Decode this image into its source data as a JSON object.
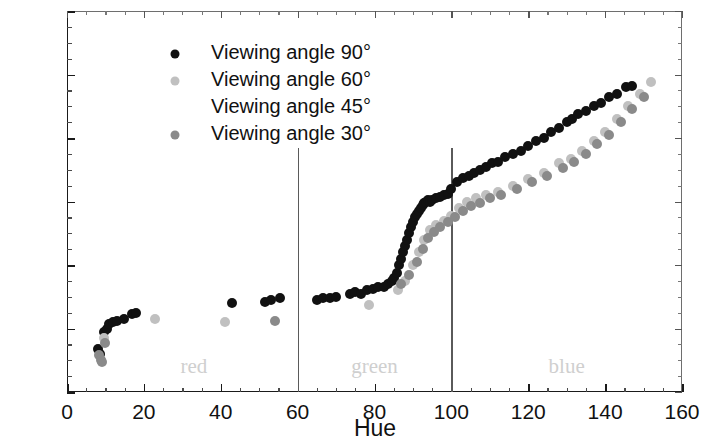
{
  "chart_data": {
    "type": "scatter",
    "title": "",
    "xlabel": "Hue",
    "ylabel": "Temperature (°C)",
    "xlim": [
      0,
      160
    ],
    "ylim": [
      34,
      46
    ],
    "xticks": [
      0,
      20,
      40,
      60,
      80,
      100,
      120,
      140,
      160
    ],
    "yticks": [
      34,
      36,
      38,
      40,
      42,
      44,
      46
    ],
    "x_minor_step": 5,
    "y_minor_step": 0.5,
    "grid": false,
    "legend_position": "top-left",
    "annotations": [
      {
        "text": "red",
        "x": 33,
        "y": 34.75
      },
      {
        "text": "green",
        "x": 80,
        "y": 34.75
      },
      {
        "text": "blue",
        "x": 130,
        "y": 34.75
      }
    ],
    "vertical_dividers": [
      60,
      100
    ],
    "series": [
      {
        "name": "Viewing angle 90°",
        "color": "#111111",
        "marker": "circle",
        "points": [
          [
            8.0,
            35.35
          ],
          [
            8.6,
            35.2
          ],
          [
            9.6,
            35.9
          ],
          [
            10.3,
            36.0
          ],
          [
            11.0,
            36.15
          ],
          [
            12.0,
            36.2
          ],
          [
            13.0,
            36.25
          ],
          [
            14.8,
            36.3
          ],
          [
            17.0,
            36.45
          ],
          [
            18.0,
            36.5
          ],
          [
            43.0,
            36.8
          ],
          [
            51.5,
            36.85
          ],
          [
            53.0,
            36.9
          ],
          [
            55.5,
            36.95
          ],
          [
            65.0,
            36.9
          ],
          [
            66.5,
            36.95
          ],
          [
            68.5,
            36.95
          ],
          [
            70.0,
            37.0
          ],
          [
            73.5,
            37.1
          ],
          [
            75.0,
            37.15
          ],
          [
            76.5,
            37.1
          ],
          [
            78.0,
            37.2
          ],
          [
            79.5,
            37.25
          ],
          [
            81.0,
            37.3
          ],
          [
            82.5,
            37.3
          ],
          [
            83.5,
            37.4
          ],
          [
            84.5,
            37.5
          ],
          [
            85.0,
            37.6
          ],
          [
            85.8,
            37.75
          ],
          [
            86.5,
            38.0
          ],
          [
            87.0,
            38.2
          ],
          [
            87.5,
            38.4
          ],
          [
            88.0,
            38.6
          ],
          [
            88.5,
            38.8
          ],
          [
            89.0,
            39.0
          ],
          [
            89.5,
            39.2
          ],
          [
            90.0,
            39.35
          ],
          [
            90.5,
            39.5
          ],
          [
            91.0,
            39.6
          ],
          [
            91.5,
            39.7
          ],
          [
            92.0,
            39.8
          ],
          [
            92.5,
            39.9
          ],
          [
            93.0,
            39.95
          ],
          [
            93.5,
            40.0
          ],
          [
            94.0,
            40.05
          ],
          [
            94.5,
            40.0
          ],
          [
            95.0,
            40.05
          ],
          [
            96.0,
            40.1
          ],
          [
            97.0,
            40.15
          ],
          [
            98.0,
            40.2
          ],
          [
            99.0,
            40.25
          ],
          [
            100.0,
            40.4
          ],
          [
            101.5,
            40.6
          ],
          [
            103.0,
            40.75
          ],
          [
            104.5,
            40.8
          ],
          [
            106.0,
            40.9
          ],
          [
            107.5,
            41.0
          ],
          [
            109.0,
            41.1
          ],
          [
            110.5,
            41.2
          ],
          [
            112.0,
            41.25
          ],
          [
            114.0,
            41.4
          ],
          [
            116.0,
            41.5
          ],
          [
            118.0,
            41.6
          ],
          [
            120.0,
            41.75
          ],
          [
            122.0,
            41.9
          ],
          [
            124.0,
            42.0
          ],
          [
            126.0,
            42.2
          ],
          [
            128.0,
            42.3
          ],
          [
            130.0,
            42.5
          ],
          [
            131.5,
            42.6
          ],
          [
            133.0,
            42.75
          ],
          [
            135.0,
            42.85
          ],
          [
            137.0,
            43.0
          ],
          [
            139.0,
            43.1
          ],
          [
            141.0,
            43.3
          ],
          [
            143.0,
            43.4
          ],
          [
            145.5,
            43.6
          ],
          [
            147.0,
            43.65
          ]
        ]
      },
      {
        "name": "Viewing angle 60°",
        "color": "#c0c0c0",
        "marker": "circle",
        "points": [
          [
            9.5,
            35.7
          ],
          [
            23.0,
            36.3
          ],
          [
            41.0,
            36.2
          ],
          [
            78.5,
            36.75
          ],
          [
            86.0,
            37.2
          ],
          [
            88.0,
            37.5
          ],
          [
            90.0,
            38.0
          ],
          [
            91.5,
            38.4
          ],
          [
            93.0,
            38.8
          ],
          [
            94.5,
            39.1
          ],
          [
            96.0,
            39.25
          ],
          [
            98.0,
            39.4
          ],
          [
            100.0,
            39.55
          ],
          [
            102.0,
            39.8
          ],
          [
            104.0,
            40.0
          ],
          [
            106.5,
            40.1
          ],
          [
            109.0,
            40.2
          ],
          [
            112.0,
            40.3
          ],
          [
            116.0,
            40.5
          ],
          [
            120.0,
            40.7
          ],
          [
            124.0,
            40.9
          ],
          [
            128.0,
            41.2
          ],
          [
            131.0,
            41.35
          ],
          [
            134.0,
            41.6
          ],
          [
            137.0,
            41.9
          ],
          [
            140.0,
            42.2
          ],
          [
            143.0,
            42.6
          ],
          [
            146.0,
            43.0
          ],
          [
            149.0,
            43.4
          ],
          [
            152.0,
            43.75
          ]
        ]
      },
      {
        "name": "Viewing angle 45°",
        "color": "#ffffff",
        "marker": "none",
        "points": []
      },
      {
        "name": "Viewing angle 30°",
        "color": "#8a8a8a",
        "marker": "circle",
        "points": [
          [
            8.2,
            35.15
          ],
          [
            8.8,
            35.0
          ],
          [
            9.2,
            34.95
          ],
          [
            10.0,
            35.55
          ],
          [
            54.0,
            36.25
          ],
          [
            87.0,
            37.4
          ],
          [
            89.0,
            37.7
          ],
          [
            91.0,
            38.1
          ],
          [
            92.5,
            38.5
          ],
          [
            94.0,
            38.85
          ],
          [
            95.5,
            39.05
          ],
          [
            97.0,
            39.2
          ],
          [
            99.0,
            39.35
          ],
          [
            101.0,
            39.5
          ],
          [
            103.0,
            39.7
          ],
          [
            105.0,
            39.85
          ],
          [
            107.5,
            39.95
          ],
          [
            110.0,
            40.1
          ],
          [
            113.0,
            40.2
          ],
          [
            117.0,
            40.4
          ],
          [
            121.0,
            40.6
          ],
          [
            125.0,
            40.8
          ],
          [
            129.0,
            41.05
          ],
          [
            132.0,
            41.25
          ],
          [
            135.0,
            41.5
          ],
          [
            138.0,
            41.8
          ],
          [
            141.0,
            42.1
          ],
          [
            144.0,
            42.5
          ],
          [
            147.0,
            42.9
          ],
          [
            150.0,
            43.3
          ]
        ]
      }
    ]
  },
  "legend": {
    "items": [
      {
        "label": "Viewing angle 90°",
        "color": "#111111",
        "has_marker": true
      },
      {
        "label": "Viewing angle 60°",
        "color": "#c0c0c0",
        "has_marker": true
      },
      {
        "label": "Viewing angle 45°",
        "color": "#ffffff",
        "has_marker": false
      },
      {
        "label": "Viewing angle 30°",
        "color": "#8a8a8a",
        "has_marker": true
      }
    ]
  }
}
